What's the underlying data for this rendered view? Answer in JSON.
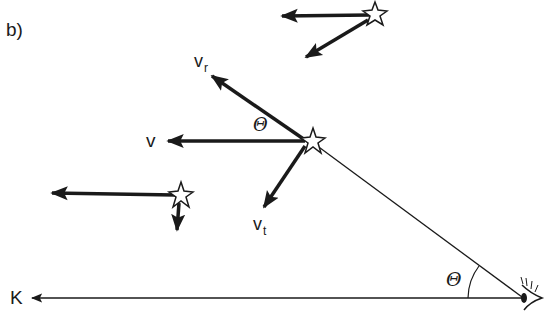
{
  "figure": {
    "panel_label": "b)",
    "colors": {
      "ink": "#1a1a1a",
      "background": "#ffffff"
    },
    "labels": {
      "v_radial": {
        "main": "v",
        "sub": "r"
      },
      "v_total": "v",
      "v_tangential": {
        "main": "v",
        "sub": "t"
      },
      "angle_at_star": "Θ",
      "angle_at_observer": "Θ",
      "direction_K": "K"
    },
    "elements": {
      "stars": [
        "star-top-right",
        "star-center",
        "star-left"
      ],
      "observer": "eye-icon",
      "line_of_sight": "line from observer to central star",
      "reference_direction": "arrow pointing left labeled K"
    }
  }
}
